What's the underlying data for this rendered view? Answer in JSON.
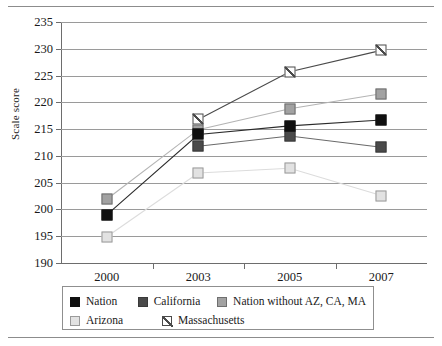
{
  "chart_data": {
    "type": "line",
    "title": "",
    "xlabel": "",
    "ylabel": "Scale score",
    "categories": [
      "2000",
      "2003",
      "2005",
      "2007"
    ],
    "ylim": [
      190,
      235
    ],
    "yticks": [
      190,
      195,
      200,
      205,
      210,
      215,
      220,
      225,
      230,
      235
    ],
    "grid": true,
    "legend_position": "bottom",
    "series": [
      {
        "name": "Nation",
        "color": "#101010",
        "marker": "filled-square-black",
        "values": [
          199,
          214,
          215.6,
          216.7
        ],
        "x": [
          "2000",
          "2003",
          "2005",
          "2007"
        ]
      },
      {
        "name": "California",
        "color": "#4a4a4a",
        "marker": "filled-square-dark-gray",
        "values": [
          null,
          211.8,
          213.7,
          211.6
        ],
        "x": [
          "2000",
          "2003",
          "2005",
          "2007"
        ]
      },
      {
        "name": "Nation without AZ, CA, MA",
        "color": "#a2a2a2",
        "marker": "filled-square-gray",
        "values": [
          201.9,
          214.9,
          218.8,
          221.6
        ],
        "x": [
          "2000",
          "2003",
          "2005",
          "2007"
        ]
      },
      {
        "name": "Arizona",
        "color": "#e2e2e2",
        "marker": "square-light-gray",
        "values": [
          194.9,
          206.8,
          207.7,
          202.6
        ],
        "x": [
          "2000",
          "2003",
          "2005",
          "2007"
        ]
      },
      {
        "name": "Massachusetts",
        "color": "#fdfdfd",
        "marker": "hatched-square-white",
        "values": [
          null,
          216.8,
          225.7,
          229.7
        ],
        "x": [
          "2000",
          "2003",
          "2005",
          "2007"
        ]
      }
    ]
  },
  "axes": {
    "ytick_labels": [
      "235",
      "230",
      "225",
      "220",
      "215",
      "210",
      "205",
      "200",
      "195",
      "190"
    ],
    "xtick_labels": [
      "2000",
      "2003",
      "2005",
      "2007"
    ],
    "ylabel": "Scale score"
  },
  "legend": {
    "items": [
      {
        "label": "Nation",
        "swatch": "filled-square-black"
      },
      {
        "label": "California",
        "swatch": "filled-square-dark-gray"
      },
      {
        "label": "Nation without AZ, CA, MA",
        "swatch": "filled-square-gray"
      },
      {
        "label": "Arizona",
        "swatch": "square-light-gray"
      },
      {
        "label": "Massachusetts",
        "swatch": "hatched-square-white"
      }
    ]
  },
  "colors": {
    "nation": "#101010",
    "california": "#4a4a4a",
    "nation_without": "#a2a2a2",
    "arizona": "#e2e2e2",
    "massachusetts": "#fdfdfd",
    "grid": "#9a9a9a",
    "axis": "#6d6d6d",
    "rule": "#8c8c8c"
  }
}
